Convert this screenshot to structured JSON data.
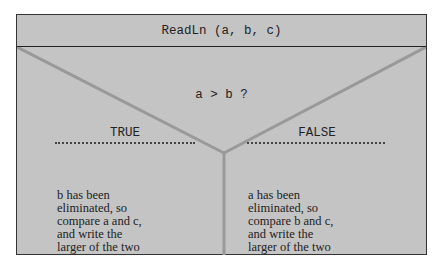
{
  "header": {
    "statement": "ReadLn (a, b, c)"
  },
  "decision": {
    "condition": "a > b ?"
  },
  "branches": [
    {
      "label": "TRUE",
      "lines": [
        "b  has been",
        "eliminated, so",
        "compare a and c,",
        "and write the",
        "larger of the two"
      ]
    },
    {
      "label": "FALSE",
      "lines": [
        "a has been",
        "eliminated, so",
        "compare b and c,",
        "and write the",
        "larger of the two"
      ]
    }
  ],
  "colors": {
    "background": "#c4c4c4",
    "border": "#333333",
    "divider": "#999999"
  }
}
